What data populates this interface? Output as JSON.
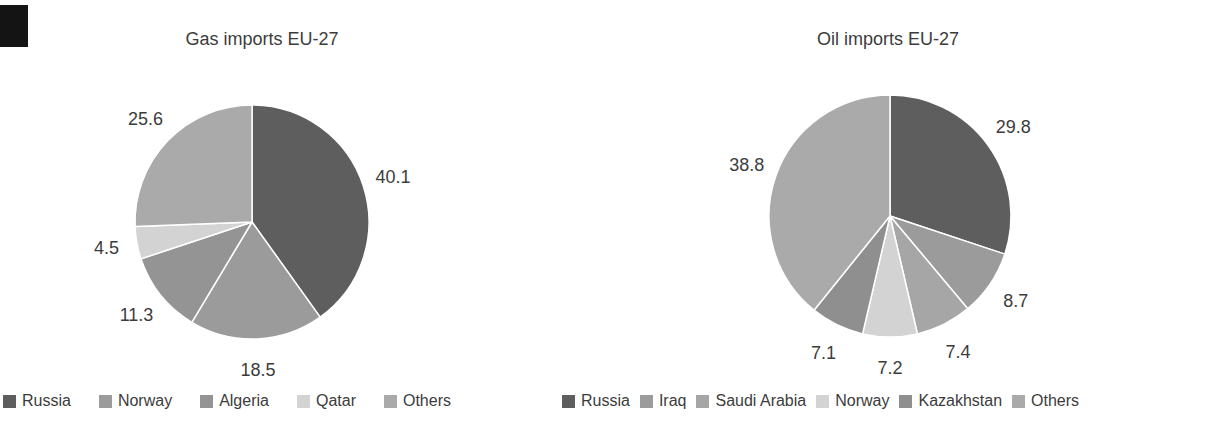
{
  "scan_artifact": {
    "color": "#141414"
  },
  "text_color": "#3c3c3c",
  "chart_data": [
    {
      "type": "pie",
      "title": "Gas imports EU-27",
      "categories": [
        "Russia",
        "Norway",
        "Algeria",
        "Qatar",
        "Others"
      ],
      "values": [
        40.1,
        18.5,
        11.3,
        4.5,
        25.6
      ],
      "colors": [
        "#5e5e5e",
        "#9b9b9b",
        "#949494",
        "#d3d3d3",
        "#aaaaaa"
      ],
      "data_labels": [
        "40.1",
        "18.5",
        "11.3",
        "4.5",
        "25.6"
      ],
      "start_angle": "12-oclock",
      "direction": "clockwise",
      "data_label_position": "outside",
      "legend_position": "bottom"
    },
    {
      "type": "pie",
      "title": "Oil imports EU-27",
      "categories": [
        "Russia",
        "Iraq",
        "Saudi Arabia",
        "Norway",
        "Kazakhstan",
        "Others"
      ],
      "values": [
        29.8,
        8.7,
        7.4,
        7.2,
        7.1,
        38.8
      ],
      "colors": [
        "#5e5e5e",
        "#9b9b9b",
        "#a6a6a6",
        "#d3d3d3",
        "#8f8f8f",
        "#aaaaaa"
      ],
      "data_labels": [
        "29.8",
        "8.7",
        "7.4",
        "7.2",
        "7.1",
        "38.8"
      ],
      "start_angle": "12-oclock",
      "direction": "clockwise",
      "data_label_position": "outside",
      "legend_position": "bottom"
    }
  ]
}
